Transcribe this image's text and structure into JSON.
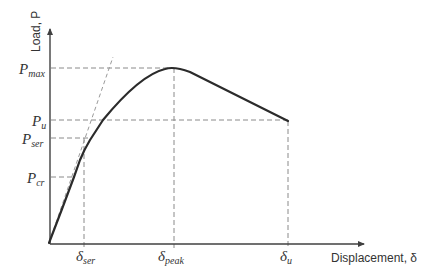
{
  "diagram": {
    "colors": {
      "axis": "#404040",
      "curve": "#2b2b2b",
      "dash": "#8a8a8a",
      "text": "#333333"
    },
    "axes": {
      "y_label": "Load, P",
      "x_label": "Displacement, δ"
    },
    "y_levels": [
      {
        "key": "P_max",
        "main": "P",
        "sub": "max",
        "y": 68
      },
      {
        "key": "P_u",
        "main": "P",
        "sub": "u",
        "y": 120
      },
      {
        "key": "P_ser",
        "main": "P",
        "sub": "ser",
        "y": 138
      },
      {
        "key": "P_cr",
        "main": "P",
        "sub": "cr",
        "y": 177
      }
    ],
    "x_levels": [
      {
        "key": "delta_ser",
        "main": "δ",
        "sub": "ser",
        "x": 84
      },
      {
        "key": "delta_peak",
        "main": "δ",
        "sub": "peak",
        "x": 174
      },
      {
        "key": "delta_u",
        "main": "δ",
        "sub": "u",
        "x": 288
      }
    ],
    "points": {
      "origin": [
        49,
        243
      ],
      "cracking": [
        74,
        177
      ],
      "service": [
        84,
        150
      ],
      "u_cross": [
        103,
        120
      ],
      "peak": [
        174,
        68
      ],
      "ultimate": [
        288,
        121
      ]
    },
    "tangent_line": {
      "from": [
        49,
        243
      ],
      "to": [
        113,
        57
      ]
    }
  }
}
